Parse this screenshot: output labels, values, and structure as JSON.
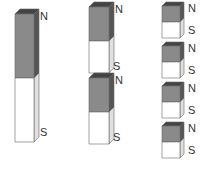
{
  "colors": {
    "north_face": "#8a8a8a",
    "north_top": "#444444",
    "north_side": "#555555",
    "south_face": "#ffffff",
    "south_side": "#e0e0e0",
    "outline": "#666666",
    "label": "#333333"
  },
  "magnets": [
    {
      "id": "large",
      "x": 15,
      "y": 14,
      "w": 19,
      "h": 128,
      "depth": 5,
      "split": 0.5,
      "n_label": "N",
      "s_label": "S",
      "n_pos": [
        40,
        11
      ],
      "s_pos": [
        40,
        127
      ]
    },
    {
      "id": "medium-1",
      "x": 89,
      "y": 7,
      "w": 20,
      "h": 66,
      "depth": 5,
      "split": 0.52,
      "n_label": "N",
      "s_label": "S",
      "n_pos": [
        115,
        4
      ],
      "s_pos": [
        113,
        61
      ]
    },
    {
      "id": "medium-2",
      "x": 89,
      "y": 78,
      "w": 20,
      "h": 66,
      "depth": 5,
      "split": 0.52,
      "n_label": "N",
      "s_label": "S",
      "n_pos": [
        115,
        75
      ],
      "s_pos": [
        113,
        132
      ]
    },
    {
      "id": "small-1",
      "x": 162,
      "y": 6,
      "w": 18,
      "h": 32,
      "depth": 4,
      "split": 0.5,
      "n_label": "N",
      "s_label": "S",
      "n_pos": [
        188,
        3
      ],
      "s_pos": [
        188,
        25
      ]
    },
    {
      "id": "small-2",
      "x": 162,
      "y": 46,
      "w": 18,
      "h": 32,
      "depth": 4,
      "split": 0.5,
      "n_label": "N",
      "s_label": "S",
      "n_pos": [
        188,
        43
      ],
      "s_pos": [
        188,
        65
      ]
    },
    {
      "id": "small-3",
      "x": 162,
      "y": 86,
      "w": 18,
      "h": 32,
      "depth": 4,
      "split": 0.5,
      "n_label": "N",
      "s_label": "S",
      "n_pos": [
        188,
        83
      ],
      "s_pos": [
        188,
        105
      ]
    },
    {
      "id": "small-4",
      "x": 162,
      "y": 126,
      "w": 18,
      "h": 32,
      "depth": 4,
      "split": 0.5,
      "n_label": "N",
      "s_label": "S",
      "n_pos": [
        188,
        123
      ],
      "s_pos": [
        188,
        145
      ]
    }
  ]
}
